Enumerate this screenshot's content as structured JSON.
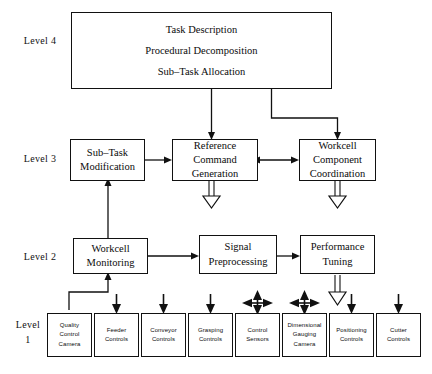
{
  "diagram": {
    "background_color": "#ffffff",
    "line_color": "#111111",
    "levels": [
      {
        "id": "level4",
        "label": "Level 4"
      },
      {
        "id": "level3",
        "label": "Level 3"
      },
      {
        "id": "level2",
        "label": "Level 2"
      },
      {
        "id": "level1",
        "label": "Level\n1"
      }
    ],
    "level4": {
      "box": {
        "label": "Task Description\nProcedural Decomposition\nSub–Task Allocation"
      }
    },
    "level3": {
      "boxes": [
        {
          "id": "sub-task-modification",
          "label": "Sub–Task\nModification"
        },
        {
          "id": "reference-command-generation",
          "label": "Reference\nCommand\nGeneration"
        },
        {
          "id": "workcell-component-coordination",
          "label": "Workcell\nComponent\nCoordination"
        }
      ]
    },
    "level2": {
      "boxes": [
        {
          "id": "workcell-monitoring",
          "label": "Workcell\nMonitoring"
        },
        {
          "id": "signal-preprocessing",
          "label": "Signal\nPreprocessing"
        },
        {
          "id": "performance-tuning",
          "label": "Performance\nTuning"
        }
      ]
    },
    "level1": {
      "boxes": [
        {
          "id": "quality-control-camera",
          "label": "Quality\nControl\nCamera"
        },
        {
          "id": "feeder-controls",
          "label": "Feeder\nControls"
        },
        {
          "id": "conveyor-controls",
          "label": "Conveyor\nControls"
        },
        {
          "id": "grasping-controls",
          "label": "Grasping\nControls"
        },
        {
          "id": "control-sensors",
          "label": "Control\nSensors"
        },
        {
          "id": "dimensional-gauging-camera",
          "label": "Dimensional\nGauging\nCamera"
        },
        {
          "id": "positioning-controls",
          "label": "Positioning\nControls"
        },
        {
          "id": "cutter-controls",
          "label": "Cutter\nControls"
        }
      ]
    }
  }
}
